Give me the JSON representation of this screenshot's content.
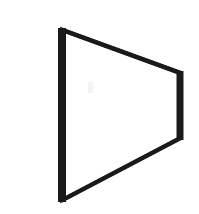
{
  "figure": {
    "label": "a)",
    "caption_prefix": "a",
    "ink_color": "#1a1a1a",
    "background_color": "#ffffff",
    "width": 199,
    "height": 214
  },
  "shape": {
    "name": "trapezoid-outline",
    "description": "Quadrilateral outline, taller left side, shorter right side",
    "stroke_color": "#1a1a1a",
    "fill_color": "#ffffff",
    "left_edge_thickness": 8,
    "right_edge_thickness": 7,
    "slant_edge_thickness": 4,
    "vertices": {
      "top_left": {
        "x": 62,
        "y": 30
      },
      "top_right": {
        "x": 180,
        "y": 73
      },
      "bottom_right": {
        "x": 180,
        "y": 138
      },
      "bottom_left": {
        "x": 62,
        "y": 200
      }
    },
    "outline_path": "M 62 30 L 180 73 L 180 138 L 62 200 Z"
  }
}
